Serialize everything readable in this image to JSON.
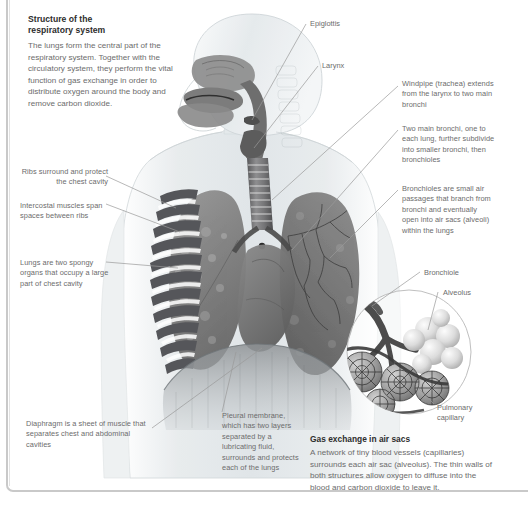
{
  "figure": {
    "subject": "Structure of the respiratory system",
    "style": "grayscale anatomical illustration with leader-line callouts"
  },
  "intro": {
    "title_line1": "Structure of the",
    "title_line2": "respiratory system",
    "body": "The lungs form the central part of the respiratory system. Together with the circulatory system, they perform the vital function of gas exchange in order to distribute oxygen around the body and remove carbon dioxide."
  },
  "callouts": {
    "epiglottis": "Epiglottis",
    "larynx": "Larynx",
    "windpipe": "Windpipe (trachea) extends from the larynx to two main bronchi",
    "bronchi": "Two main bronchi, one to each lung, further subdivide into smaller bronchi, then bronchioles",
    "bronchioles": "Bronchioles are small air passages that branch from bronchi and eventually open into air sacs (alveoli) within the lungs",
    "ribs": "Ribs surround and protect the chest cavity",
    "intercostal": "Intercostal muscles span spaces between ribs",
    "lungs": "Lungs are two spongy organs that occupy a large part of chest cavity",
    "diaphragm": "Diaphragm is a sheet of muscle that separates chest and abdominal cavities",
    "pleural": "Pleural membrane, which has two layers separated by a lubricating fluid, surrounds and protects each of the lungs",
    "bronchiole": "Bronchiole",
    "alveolus": "Alveolus",
    "pulmonary_capillary_line1": "Pulmonary",
    "pulmonary_capillary_line2": "capillary"
  },
  "inset": {
    "title": "Gas exchange in air sacs",
    "body": "A network of tiny blood vessels (capillaries) surrounds each air sac (alveolus). The thin walls of both structures allow oxygen to diffuse into the blood and carbon dioxide to leave it."
  },
  "colors": {
    "background": "#ffffff",
    "text": "#6c6c6c",
    "heading": "#2d2d2d",
    "leader_line": "#9a9a9a",
    "body_silhouette": "#d8dcde",
    "lung_tissue": "#7e7e7e",
    "rib_bone": "#58595b",
    "frame": "#c9c9c9"
  }
}
